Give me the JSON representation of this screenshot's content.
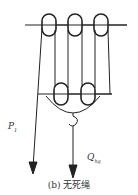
{
  "diagram": {
    "caption": "(b) 无死绳",
    "labels": {
      "pull_force": "P",
      "pull_force_sub": "1",
      "load": "Q",
      "load_sub": "hg"
    },
    "components": [
      "fixed-pulley-block (3 sheaves)",
      "traveling-block (2 sheaves)",
      "hook",
      "fast-line",
      "load-arrow"
    ]
  }
}
